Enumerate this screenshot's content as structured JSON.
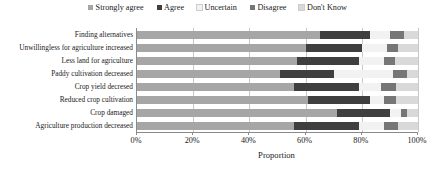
{
  "chart_data": {
    "type": "bar",
    "orientation": "horizontal",
    "stacked": true,
    "title": "",
    "xlabel": "Proportion",
    "ylabel": "",
    "xlim": [
      0,
      100
    ],
    "xticks": [
      "0%",
      "20%",
      "40%",
      "60%",
      "80%",
      "100%"
    ],
    "xtick_values": [
      0,
      20,
      40,
      60,
      80,
      100
    ],
    "grid": true,
    "legend_position": "top-center",
    "categories": [
      "Finding alternatives",
      "Unwillingless for agriculture increased",
      "Less land for agriculture",
      "Paddy cultivation decreased",
      "Crop yield decresed",
      "Reduced crop cultivation",
      "Crop damaged",
      "Agriculture production decreased"
    ],
    "series": [
      {
        "name": "Strongly agree",
        "color": "#a6a6a6",
        "values": [
          65,
          60,
          57,
          51,
          56,
          61,
          71,
          56
        ]
      },
      {
        "name": "Agree",
        "color": "#3f3f3f",
        "values": [
          18,
          20,
          22,
          19,
          23,
          22,
          19,
          23
        ]
      },
      {
        "name": "Uncertain",
        "color": "#f2f2f2",
        "values": [
          7,
          9,
          9,
          21,
          8,
          5,
          4,
          9
        ]
      },
      {
        "name": "Disagree",
        "color": "#767676",
        "values": [
          5,
          4,
          4,
          5,
          5,
          4,
          2,
          5
        ]
      },
      {
        "name": "Don't Know",
        "color": "#d9d9d9",
        "values": [
          5,
          7,
          8,
          4,
          8,
          8,
          4,
          7
        ]
      }
    ]
  },
  "legend": {
    "items": [
      {
        "label": "Strongly agree",
        "color": "#a6a6a6"
      },
      {
        "label": "Agree",
        "color": "#3f3f3f"
      },
      {
        "label": "Uncertain",
        "color": "#f2f2f2"
      },
      {
        "label": "Disagree",
        "color": "#767676"
      },
      {
        "label": "Don't Know",
        "color": "#d9d9d9"
      }
    ]
  },
  "axis": {
    "x_title": "Proportion",
    "tick_labels": [
      "0%",
      "20%",
      "40%",
      "60%",
      "80%",
      "100%"
    ]
  },
  "colors": {
    "grid": "#c8c8c8",
    "axis": "#8a8a8a",
    "text": "#1a1a1a",
    "background": "#ffffff"
  }
}
